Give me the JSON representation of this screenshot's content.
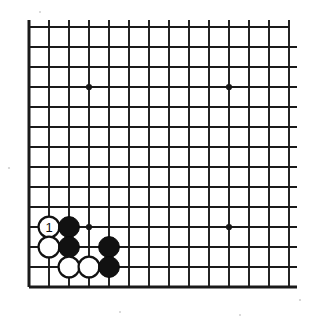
{
  "diagram": {
    "board": {
      "type": "go-board-partial",
      "columns": 14,
      "rows": 14,
      "origin_x": 29,
      "origin_y": 27,
      "spacing": 20,
      "line_color": "#1a1a1a",
      "background_color": "#ffffff",
      "edge_sides": [
        "left",
        "bottom"
      ]
    },
    "star_points": [
      {
        "name": "star-point-upper-left",
        "col": 3,
        "row": 3
      },
      {
        "name": "star-point-upper-right",
        "col": 10,
        "row": 3
      },
      {
        "name": "star-point-lower-left",
        "col": 3,
        "row": 10
      },
      {
        "name": "star-point-lower-right",
        "col": 10,
        "row": 10
      }
    ],
    "stones": [
      {
        "name": "white-stone-move-1",
        "color": "white",
        "col": 1,
        "row": 10,
        "label": "1"
      },
      {
        "name": "black-stone-a",
        "color": "black",
        "col": 2,
        "row": 10,
        "label": ""
      },
      {
        "name": "white-stone-b",
        "color": "white",
        "col": 1,
        "row": 11,
        "label": ""
      },
      {
        "name": "black-stone-c",
        "color": "black",
        "col": 2,
        "row": 11,
        "label": ""
      },
      {
        "name": "black-stone-d",
        "color": "black",
        "col": 4,
        "row": 11,
        "label": ""
      },
      {
        "name": "white-stone-e",
        "color": "white",
        "col": 2,
        "row": 12,
        "label": ""
      },
      {
        "name": "white-stone-f",
        "color": "white",
        "col": 3,
        "row": 12,
        "label": ""
      },
      {
        "name": "black-stone-g",
        "color": "black",
        "col": 4,
        "row": 12,
        "label": ""
      }
    ],
    "colors": {
      "black_stone": "#111111",
      "white_stone": "#ffffff",
      "stone_outline": "#111111",
      "grid": "#1a1a1a"
    }
  }
}
